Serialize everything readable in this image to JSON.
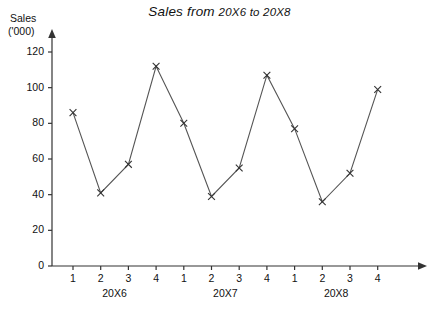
{
  "chart_data": {
    "type": "line",
    "title": "Sales from 20X6 to 20X8",
    "title_main": "Sales from",
    "title_range": "20X6 to 20X8",
    "ylabel_line1": "Sales",
    "ylabel_line2": "('000)",
    "xlabel": "",
    "ylim": [
      0,
      130
    ],
    "yticks": [
      0,
      20,
      40,
      60,
      80,
      100,
      120
    ],
    "ytick_labels": [
      "0",
      "20",
      "40",
      "60",
      "80",
      "100",
      "120"
    ],
    "grid": false,
    "legend": "none",
    "marker": "x",
    "line_color": "#555555",
    "axis_color": "#333333",
    "categories": [
      "1",
      "2",
      "3",
      "4",
      "1",
      "2",
      "3",
      "4",
      "1",
      "2",
      "3",
      "4"
    ],
    "values": [
      86,
      41,
      57,
      112,
      80,
      39,
      55,
      107,
      77,
      36,
      52,
      99
    ],
    "groups": [
      {
        "label": "20X6",
        "start": 0,
        "end": 3
      },
      {
        "label": "20X7",
        "start": 4,
        "end": 7
      },
      {
        "label": "20X8",
        "start": 8,
        "end": 11
      }
    ]
  }
}
